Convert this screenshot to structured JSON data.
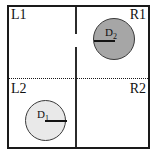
{
  "figure": {
    "quadrant_labels": {
      "top_left": "L1",
      "top_right": "R1",
      "bottom_left": "L2",
      "bottom_right": "R2"
    },
    "disks": [
      {
        "id": "D2",
        "label_base": "D",
        "label_subscript": "2",
        "quadrant": "R1",
        "fill_color": "#a6a6a6",
        "stroke_color": "#3a3a3a",
        "center_x": 114,
        "center_y": 39,
        "radius": 21,
        "radius_line_direction": "left"
      },
      {
        "id": "D1",
        "label_base": "D",
        "label_subscript": "1",
        "quadrant": "L2",
        "fill_color": "#e9e9e9",
        "stroke_color": "#3a3a3a",
        "center_x": 45,
        "center_y": 120,
        "radius": 20,
        "radius_line_direction": "right"
      }
    ],
    "dividers": {
      "vertical_style": "solid",
      "vertical_color": "#2b2b2b",
      "horizontal_style": "dotted",
      "horizontal_color": "#1a1a1a"
    },
    "frame": {
      "border_color": "#1a1a1a",
      "background_color": "#ffffff"
    },
    "caption_fragment": ""
  }
}
